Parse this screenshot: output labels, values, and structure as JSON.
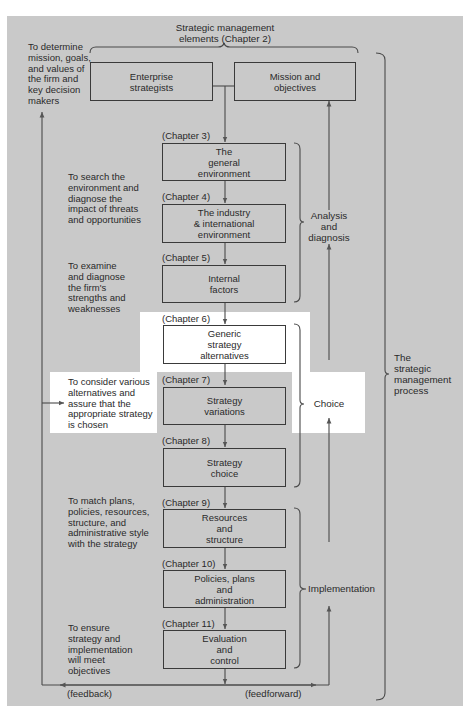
{
  "header": {
    "title_line1": "Strategic management",
    "title_line2": "elements (Chapter 2)"
  },
  "top_boxes": {
    "enterprise": [
      "Enterprise",
      "strategists"
    ],
    "mission": [
      "Mission and",
      "objectives"
    ]
  },
  "left_notes": {
    "determine": [
      "To determine",
      "mission, goals,",
      "and values of",
      "the firm and",
      "key decision",
      "makers"
    ],
    "search": [
      "To search the",
      "environment and",
      "diagnose the",
      "impact of threats",
      "and opportunities"
    ],
    "examine": [
      "To examine",
      "and diagnose",
      "the firm's",
      "strengths and",
      "weaknesses"
    ],
    "consider": [
      "To consider various",
      "alternatives and",
      "assure that the",
      "appropriate strategy",
      "is chosen"
    ],
    "match": [
      "To match plans,",
      "policies, resources,",
      "structure, and",
      "administrative style",
      "with the strategy"
    ],
    "ensure": [
      "To ensure",
      "strategy and",
      "implementation",
      "will meet",
      "objectives"
    ]
  },
  "steps": [
    {
      "chapter": "(Chapter 3)",
      "lines": [
        "The",
        "general",
        "environment"
      ]
    },
    {
      "chapter": "(Chapter 4)",
      "lines": [
        "The industry",
        "& international",
        "environment"
      ]
    },
    {
      "chapter": "(Chapter 5)",
      "lines": [
        "Internal",
        "factors"
      ]
    },
    {
      "chapter": "(Chapter 6)",
      "lines": [
        "Generic",
        "strategy",
        "alternatives"
      ]
    },
    {
      "chapter": "(Chapter 7)",
      "lines": [
        "Strategy",
        "variations"
      ]
    },
    {
      "chapter": "(Chapter 8)",
      "lines": [
        "Strategy",
        "choice"
      ]
    },
    {
      "chapter": "(Chapter 9)",
      "lines": [
        "Resources",
        "and",
        "structure"
      ]
    },
    {
      "chapter": "(Chapter 10)",
      "lines": [
        "Policies, plans",
        "and",
        "administration"
      ]
    },
    {
      "chapter": "(Chapter 11)",
      "lines": [
        "Evaluation",
        "and",
        "control"
      ]
    }
  ],
  "phases": {
    "analysis": [
      "Analysis",
      "and",
      "diagnosis"
    ],
    "choice": [
      "Choice"
    ],
    "implementation": [
      "Implementation"
    ],
    "process": [
      "The",
      "strategic",
      "management",
      "process"
    ]
  },
  "flows": {
    "feedback": "(feedback)",
    "feedforward": "(feedforward)"
  },
  "colors": {
    "panel": "#c9c9c9",
    "highlight": "#ffffff",
    "line": "#3a3a3a"
  }
}
